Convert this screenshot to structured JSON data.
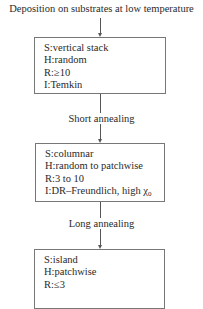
{
  "title": "Deposition on substrates at low temperature",
  "stages": [
    {
      "rows": [
        {
          "key": "S",
          "value": "vertical stack"
        },
        {
          "key": "H",
          "value": "random"
        },
        {
          "key": "R",
          "value": "≥10"
        },
        {
          "key": "I",
          "value": "Temkin"
        }
      ]
    },
    {
      "rows": [
        {
          "key": "S",
          "value": "columnar"
        },
        {
          "key": "H",
          "value": "random to patchwise"
        },
        {
          "key": "R",
          "value": "3 to 10"
        },
        {
          "key": "I",
          "value": "DR–Freundlich, high χ",
          "subscript": "0"
        }
      ]
    },
    {
      "rows": [
        {
          "key": "S",
          "value": "island"
        },
        {
          "key": "H",
          "value": "patchwise"
        },
        {
          "key": "R",
          "value": "≤3"
        }
      ]
    }
  ],
  "transitions": [
    {
      "label": "Short annealing"
    },
    {
      "label": "Long annealing"
    }
  ],
  "separator": ":"
}
